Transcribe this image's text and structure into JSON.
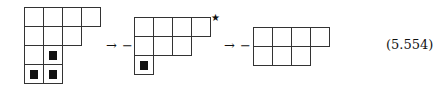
{
  "equation_number": "(5.554)",
  "symbols": {
    "arrow": "→",
    "minus": "−",
    "star": "★"
  },
  "diagrams": [
    {
      "name": "young-diagram-1",
      "row_lengths": [
        4,
        3,
        2,
        2
      ],
      "marked_cells": [
        [
          2,
          1
        ],
        [
          3,
          0
        ],
        [
          3,
          1
        ]
      ]
    },
    {
      "name": "young-diagram-2",
      "row_lengths": [
        4,
        3,
        1
      ],
      "marked_cells": [
        [
          2,
          0
        ]
      ],
      "star_at_row_end": 0
    },
    {
      "name": "young-diagram-3",
      "row_lengths": [
        4,
        3
      ],
      "marked_cells": []
    }
  ]
}
